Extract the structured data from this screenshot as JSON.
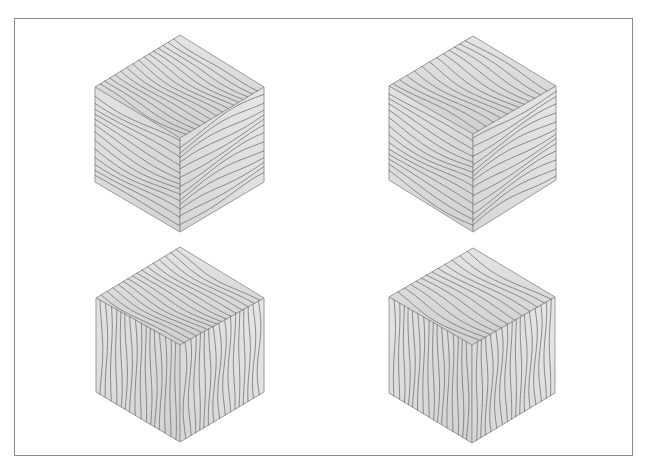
{
  "figure": {
    "frame_color": "#8a8a8a",
    "background": "#ffffff",
    "grain_color": "#7d7d7d",
    "edge_color": "#9a9a9a",
    "cubes": [
      {
        "id": "cube-top-left",
        "grain": "horizontal-sides",
        "top_face": "wavy-diagonal-v",
        "vertices": {
          "top": [
            180,
            35
          ],
          "left": [
            95,
            87
          ],
          "center": [
            180,
            138
          ],
          "right": [
            264,
            87
          ],
          "bottom": [
            180,
            232
          ],
          "lower_left": [
            95,
            182
          ],
          "lower_right": [
            264,
            182
          ]
        }
      },
      {
        "id": "cube-top-right",
        "grain": "horizontal-sides",
        "top_face": "diagonal-parallel",
        "vertices": {
          "top": [
            473,
            36
          ],
          "left": [
            389,
            86
          ],
          "center": [
            473,
            134
          ],
          "right": [
            556,
            86
          ],
          "bottom": [
            473,
            232
          ],
          "lower_left": [
            389,
            180
          ],
          "lower_right": [
            556,
            180
          ]
        }
      },
      {
        "id": "cube-bottom-left",
        "grain": "vertical-sides",
        "top_face": "wavy-diagonal-v",
        "vertices": {
          "top": [
            180,
            247
          ],
          "left": [
            96,
            298
          ],
          "center": [
            180,
            345
          ],
          "right": [
            264,
            298
          ],
          "bottom": [
            180,
            442
          ],
          "lower_left": [
            96,
            392
          ],
          "lower_right": [
            264,
            392
          ]
        }
      },
      {
        "id": "cube-bottom-right",
        "grain": "vertical-sides",
        "top_face": "diagonal-parallel",
        "vertices": {
          "top": [
            473,
            248
          ],
          "left": [
            389,
            297
          ],
          "center": [
            472,
            345
          ],
          "right": [
            555,
            297
          ],
          "bottom": [
            472,
            443
          ],
          "lower_left": [
            389,
            393
          ],
          "lower_right": [
            555,
            393
          ]
        }
      }
    ]
  }
}
